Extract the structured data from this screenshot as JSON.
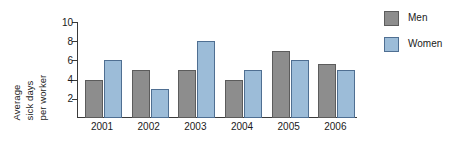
{
  "chart_data": {
    "type": "bar",
    "title": "",
    "subtitle": "",
    "xlabel": "",
    "ylabel": "Average sick days per worker",
    "ylabel_lines": [
      "Average",
      "sick days",
      "per worker"
    ],
    "categories": [
      "2001",
      "2002",
      "2003",
      "2004",
      "2005",
      "2006"
    ],
    "series": [
      {
        "name": "Men",
        "color": "#8d8d8d",
        "values": [
          4,
          5,
          5,
          4,
          7,
          5.6
        ]
      },
      {
        "name": "Women",
        "color": "#9cbcd8",
        "values": [
          6,
          3,
          8,
          5,
          6,
          5
        ]
      }
    ],
    "ylim": [
      0,
      10
    ],
    "yticks": [
      2,
      4,
      6,
      8,
      10
    ],
    "ytick_labels": [
      "2",
      "4",
      "6",
      "8",
      "10"
    ],
    "grid": false,
    "legend_position": "top-right",
    "legend_entries": [
      "Men",
      "Women"
    ]
  },
  "legend": {
    "items": [
      {
        "label": "Men",
        "swatch": "men-swatch-icon"
      },
      {
        "label": "Women",
        "swatch": "women-swatch-icon"
      }
    ]
  }
}
